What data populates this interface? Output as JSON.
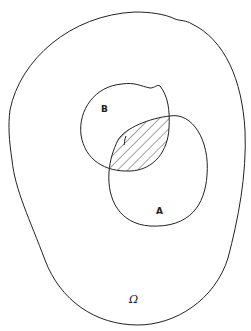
{
  "diagram": {
    "type": "venn",
    "universe": {
      "label": "Ω"
    },
    "sets": [
      {
        "id": "A",
        "label": "A"
      },
      {
        "id": "B",
        "label": "B"
      }
    ],
    "shaded_region": "A ∩ B",
    "colors": {
      "stroke": "#222222",
      "background": "#ffffff",
      "hatch": "#333333"
    }
  }
}
